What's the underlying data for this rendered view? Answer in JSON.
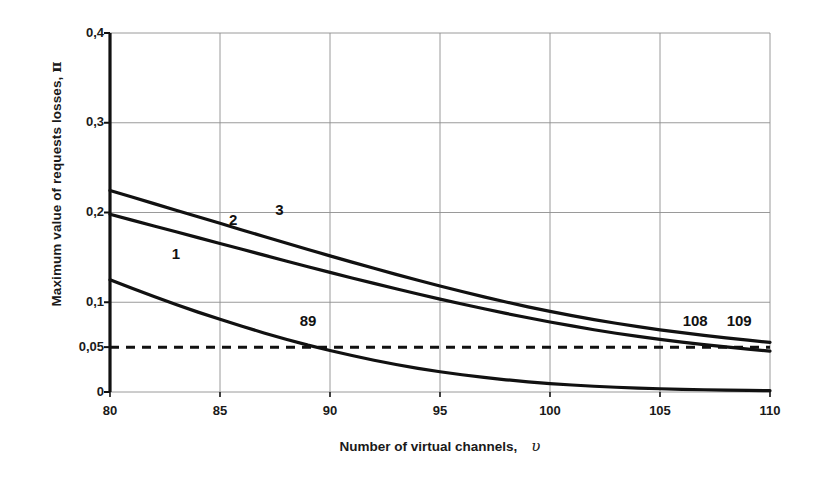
{
  "chart_data": {
    "type": "line",
    "title": "",
    "xlabel": "Number of virtual channels,",
    "xlabel_symbol": "υ",
    "ylabel": "Maximum value of requests losses,",
    "ylabel_symbol": "π",
    "xlim": [
      80,
      110
    ],
    "ylim": [
      0,
      0.4
    ],
    "xticks": [
      80,
      85,
      90,
      95,
      100,
      105,
      110
    ],
    "xticklabels": [
      "80",
      "85",
      "90",
      "95",
      "100",
      "105",
      "110"
    ],
    "yticks": [
      0,
      0.05,
      0.1,
      0.2,
      0.3,
      0.4
    ],
    "yticklabels": [
      "0",
      "0,05",
      "0,1",
      "0,2",
      "0,3",
      "0,4"
    ],
    "grid": true,
    "legend": "inline-curve-labels",
    "threshold": {
      "value": 0.05,
      "label": "0,05",
      "style": "dashed",
      "color": "#111111"
    },
    "annotations": [
      {
        "text": "1",
        "x": 83.0,
        "y": 0.148,
        "kind": "curve-label"
      },
      {
        "text": "2",
        "x": 85.6,
        "y": 0.186,
        "kind": "curve-label"
      },
      {
        "text": "3",
        "x": 87.7,
        "y": 0.197,
        "kind": "curve-label"
      },
      {
        "text": "89",
        "x": 89.0,
        "y": 0.073,
        "kind": "crossing-label"
      },
      {
        "text": "108",
        "x": 106.6,
        "y": 0.074,
        "kind": "crossing-label"
      },
      {
        "text": "109",
        "x": 108.6,
        "y": 0.074,
        "kind": "crossing-label"
      }
    ],
    "series": [
      {
        "name": "1",
        "color": "#111111",
        "crossing_threshold_at": 89,
        "x": [
          80,
          81,
          82,
          83,
          84,
          85,
          86,
          87,
          88,
          89,
          90,
          91,
          92,
          93,
          94,
          95,
          96,
          97,
          98,
          99,
          100,
          101,
          102,
          103,
          104,
          105,
          106,
          107,
          108,
          109,
          110
        ],
        "y": [
          0.125,
          0.1155,
          0.1065,
          0.0975,
          0.089,
          0.081,
          0.0732,
          0.0658,
          0.0588,
          0.0522,
          0.0462,
          0.0406,
          0.0354,
          0.0307,
          0.0264,
          0.0226,
          0.0192,
          0.0162,
          0.0136,
          0.0113,
          0.0094,
          0.0078,
          0.0064,
          0.0053,
          0.0044,
          0.0036,
          0.003,
          0.0025,
          0.0021,
          0.0018,
          0.0015
        ]
      },
      {
        "name": "2",
        "color": "#111111",
        "crossing_threshold_at": 108,
        "x": [
          80,
          81,
          82,
          83,
          84,
          85,
          86,
          87,
          88,
          89,
          90,
          91,
          92,
          93,
          94,
          95,
          96,
          97,
          98,
          99,
          100,
          101,
          102,
          103,
          104,
          105,
          106,
          107,
          108,
          109,
          110
        ],
        "y": [
          0.198,
          0.1915,
          0.185,
          0.1785,
          0.172,
          0.1655,
          0.159,
          0.1525,
          0.146,
          0.1396,
          0.1333,
          0.1271,
          0.121,
          0.115,
          0.1092,
          0.1035,
          0.098,
          0.0927,
          0.0876,
          0.0827,
          0.078,
          0.0736,
          0.0694,
          0.0655,
          0.0619,
          0.0586,
          0.0556,
          0.0528,
          0.0502,
          0.0478,
          0.0455
        ]
      },
      {
        "name": "3",
        "color": "#111111",
        "crossing_threshold_at": 109,
        "x": [
          80,
          81,
          82,
          83,
          84,
          85,
          86,
          87,
          88,
          89,
          90,
          91,
          92,
          93,
          94,
          95,
          96,
          97,
          98,
          99,
          100,
          101,
          102,
          103,
          104,
          105,
          106,
          107,
          108,
          109,
          110
        ],
        "y": [
          0.2245,
          0.2172,
          0.2099,
          0.2026,
          0.1953,
          0.188,
          0.1806,
          0.1733,
          0.166,
          0.1588,
          0.1517,
          0.1447,
          0.1378,
          0.1311,
          0.1245,
          0.1181,
          0.1119,
          0.106,
          0.1003,
          0.0949,
          0.0898,
          0.0851,
          0.0807,
          0.0766,
          0.0728,
          0.0693,
          0.0661,
          0.0631,
          0.0603,
          0.0577,
          0.0553
        ]
      }
    ]
  }
}
